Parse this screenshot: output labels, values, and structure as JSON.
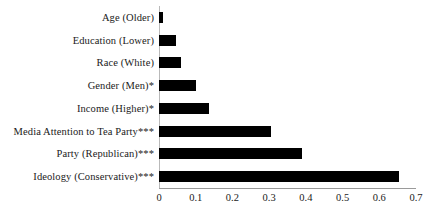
{
  "chart_data": {
    "type": "bar",
    "orientation": "horizontal",
    "title": "",
    "subtitle": "",
    "xlabel": "",
    "ylabel": "",
    "xlim": [
      0,
      0.7
    ],
    "xticks": [
      "0",
      "0.1",
      "0.2",
      "0.3",
      "0.4",
      "0.5",
      "0.6",
      "0.7"
    ],
    "xtick_values": [
      0,
      0.1,
      0.2,
      0.3,
      0.4,
      0.5,
      0.6,
      0.7
    ],
    "grid": false,
    "legend": null,
    "bar_color": "#000000",
    "axis_color": "#9a9a9a",
    "categories": [
      "Age (Older)",
      "Education (Lower)",
      "Race (White)",
      "Gender (Men)*",
      "Income (Higher)*",
      "Media Attention to Tea Party***",
      "Party (Republican)***",
      "Ideology (Conservative)***"
    ],
    "values": [
      0.01,
      0.045,
      0.06,
      0.1,
      0.135,
      0.305,
      0.39,
      0.654
    ]
  }
}
